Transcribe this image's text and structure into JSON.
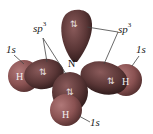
{
  "diagram": {
    "molecule": "NH3",
    "central_atom": {
      "label": "N"
    },
    "hybrid_label_left": {
      "text": "sp",
      "sup": "3"
    },
    "hybrid_label_right": {
      "text": "sp",
      "sup": "3"
    },
    "orbital_labels": [
      {
        "position": "left",
        "text": "1s"
      },
      {
        "position": "right",
        "text": "1s"
      },
      {
        "position": "bottom",
        "text": "1s"
      }
    ],
    "hydrogens": [
      {
        "position": "left",
        "label": "H"
      },
      {
        "position": "right",
        "label": "H"
      },
      {
        "position": "bottom",
        "label": "H"
      }
    ],
    "electron_pairs": [
      {
        "position": "top-lone-pair",
        "symbol": "⇅"
      },
      {
        "position": "left-bond",
        "symbol": "⇅"
      },
      {
        "position": "right-bond",
        "symbol": "⇅"
      },
      {
        "position": "bottom-bond",
        "symbol": "⇅"
      }
    ],
    "colors": {
      "sp3_lobe": "#5a3636",
      "sp3_lobe_highlight": "#8a5a5a",
      "h_sphere": "#8a5252",
      "h_sphere_highlight": "#b07878",
      "leader_line": "#444444"
    }
  }
}
